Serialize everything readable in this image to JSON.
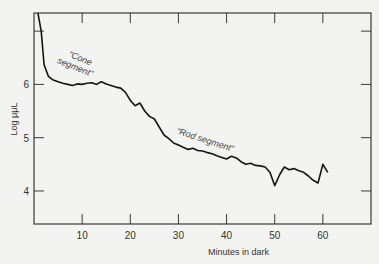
{
  "chart_data": {
    "type": "line",
    "title": "",
    "xlabel": "Minutes in dark",
    "ylabel": "Log μμL",
    "xlim": [
      0,
      70
    ],
    "ylim": [
      3.38,
      7.34
    ],
    "x_ticks": [
      10,
      20,
      30,
      40,
      50,
      60
    ],
    "x_tick_labels": [
      "10",
      "20",
      "30",
      "40",
      "50",
      "60"
    ],
    "y_ticks": [
      4,
      5,
      6,
      7
    ],
    "y_tick_labels": [
      "4",
      "5",
      "6",
      ""
    ],
    "grid": false,
    "legend": null,
    "frame": "box with ticks on all four sides",
    "annotations": [
      {
        "text": "“Cone segment”",
        "x": 11,
        "y": 6.55
      },
      {
        "text": "“Rod segment”",
        "x": 36,
        "y": 4.95
      }
    ],
    "series": [
      {
        "name": "Dark adaptation threshold",
        "x": [
          0.8,
          1.5,
          2.1,
          3,
          4,
          5,
          6,
          7,
          8,
          9,
          10,
          11,
          12,
          13,
          14,
          15,
          16,
          17,
          18,
          19,
          20,
          21,
          22,
          23,
          24,
          25,
          26,
          27,
          28,
          29,
          30,
          31,
          32,
          33,
          34,
          35,
          36,
          37,
          38,
          39,
          40,
          41,
          42,
          43,
          44,
          45,
          46,
          47,
          48,
          49,
          50,
          51,
          52,
          53,
          54,
          55,
          56,
          57,
          58,
          59,
          60,
          61
        ],
        "values": [
          7.34,
          7.0,
          6.37,
          6.15,
          6.08,
          6.05,
          6.02,
          6.0,
          5.98,
          6.01,
          6.0,
          6.02,
          6.03,
          6.0,
          6.05,
          6.01,
          5.98,
          5.95,
          5.93,
          5.85,
          5.7,
          5.6,
          5.65,
          5.5,
          5.4,
          5.35,
          5.2,
          5.05,
          4.98,
          4.9,
          4.86,
          4.82,
          4.78,
          4.8,
          4.76,
          4.75,
          4.72,
          4.7,
          4.66,
          4.63,
          4.6,
          4.65,
          4.62,
          4.55,
          4.5,
          4.52,
          4.48,
          4.47,
          4.45,
          4.35,
          4.1,
          4.3,
          4.45,
          4.4,
          4.42,
          4.38,
          4.35,
          4.28,
          4.2,
          4.15,
          4.5,
          4.35
        ]
      }
    ]
  }
}
